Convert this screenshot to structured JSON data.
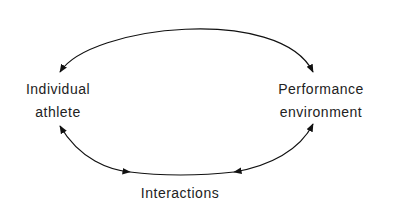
{
  "nodes": {
    "left": {
      "line1": "Individual",
      "line2": "athlete"
    },
    "right": {
      "line1": "Performance",
      "line2": "environment"
    },
    "bottom": {
      "label": "Interactions"
    }
  },
  "colors": {
    "line": "#111111",
    "text": "#222222",
    "background": "#ffffff"
  }
}
